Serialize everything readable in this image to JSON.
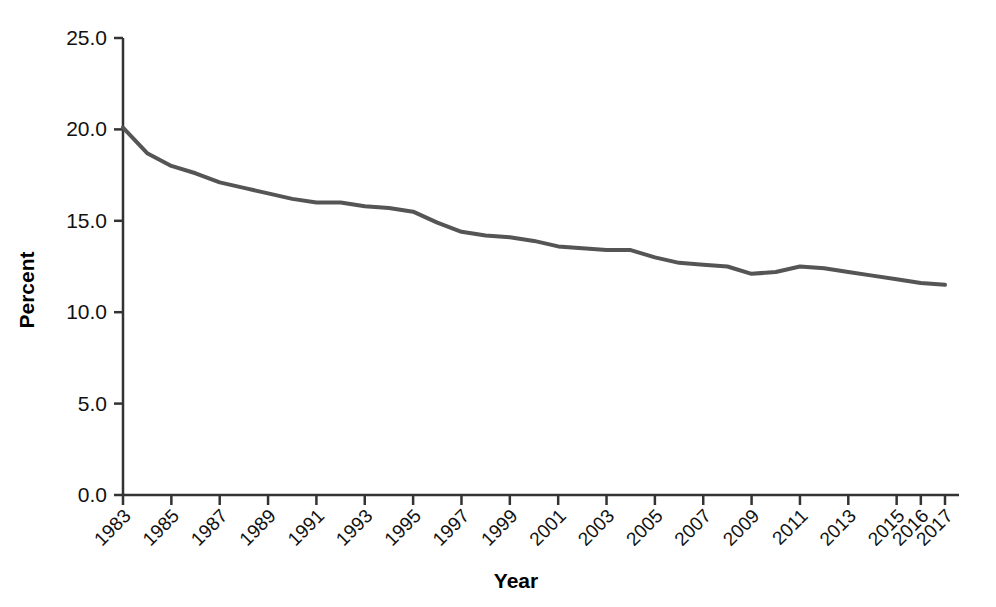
{
  "chart_data": {
    "type": "line",
    "title": "",
    "xlabel": "Year",
    "ylabel": "Percent",
    "ylim": [
      0.0,
      25.0
    ],
    "yticks": [
      0.0,
      5.0,
      10.0,
      15.0,
      20.0,
      25.0
    ],
    "ytick_labels": [
      "0.0",
      "5.0",
      "10.0",
      "15.0",
      "20.0",
      "25.0"
    ],
    "xtick_labels": [
      "1983",
      "1985",
      "1987",
      "1989",
      "1991",
      "1993",
      "1995",
      "1997",
      "1999",
      "2001",
      "2003",
      "2005",
      "2007",
      "2009",
      "2011",
      "2013",
      "2015",
      "2016",
      "2017"
    ],
    "xtick_rotation": 45,
    "grid": false,
    "legend": null,
    "line_color": "#555555",
    "line_width": 4,
    "axis_color": "#333333",
    "categories": [
      "1983",
      "1984",
      "1985",
      "1986",
      "1987",
      "1988",
      "1989",
      "1990",
      "1991",
      "1992",
      "1993",
      "1994",
      "1995",
      "1996",
      "1997",
      "1998",
      "1999",
      "2000",
      "2001",
      "2002",
      "2003",
      "2004",
      "2005",
      "2006",
      "2007",
      "2008",
      "2009",
      "2010",
      "2011",
      "2012",
      "2013",
      "2014",
      "2015",
      "2016",
      "2017"
    ],
    "values": [
      20.1,
      18.7,
      18.0,
      17.6,
      17.1,
      16.8,
      16.5,
      16.2,
      16.0,
      16.0,
      15.8,
      15.7,
      15.5,
      14.9,
      14.4,
      14.2,
      14.1,
      13.9,
      13.6,
      13.5,
      13.4,
      13.4,
      13.0,
      12.7,
      12.6,
      12.5,
      12.1,
      12.2,
      12.5,
      12.4,
      12.2,
      12.0,
      11.8,
      11.6,
      11.5
    ]
  }
}
